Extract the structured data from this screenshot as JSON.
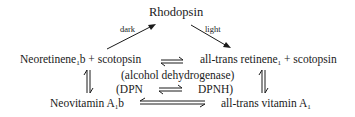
{
  "diagram": {
    "top": {
      "label": "Rhodopsin"
    },
    "edges_top": {
      "left_label": "dark",
      "right_label": "light"
    },
    "row1": {
      "left": {
        "prefix": "Neoretinene",
        "sub": "1",
        "suffix": "b + scotopsin"
      },
      "right": {
        "prefix": "all-trans retinene",
        "sub": "1",
        "suffix": " + scotopsin"
      }
    },
    "middle": {
      "enzyme": "(alcohol dehydrogenase)",
      "cofactor_left": "(DPN",
      "cofactor_right": "DPNH)"
    },
    "row2": {
      "left": {
        "prefix": "Neovitamin A",
        "sub": "1",
        "suffix": "b"
      },
      "right": {
        "prefix": "all-trans vitamin A",
        "sub": "1",
        "suffix": ""
      }
    },
    "colors": {
      "ink": "#1a1a1a",
      "background": "#ffffff"
    }
  }
}
